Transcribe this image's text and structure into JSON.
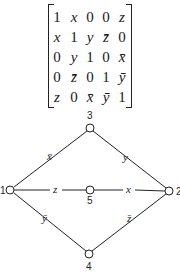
{
  "matrix": {
    "rows": [
      [
        "1",
        "x",
        "0",
        "0",
        "z"
      ],
      [
        "x",
        "1",
        "y",
        "z̄",
        "0"
      ],
      [
        "0",
        "y",
        "1",
        "0",
        "x̄"
      ],
      [
        "0",
        "z̄",
        "0",
        "1",
        "ȳ"
      ],
      [
        "z",
        "0",
        "x̄",
        "ȳ",
        "1"
      ]
    ]
  },
  "graph": {
    "nodes": [
      {
        "id": "1",
        "label": "1",
        "x": 10,
        "y": 190
      },
      {
        "id": "2",
        "label": "2",
        "x": 169,
        "y": 191
      },
      {
        "id": "3",
        "label": "3",
        "x": 90,
        "y": 128
      },
      {
        "id": "4",
        "label": "4",
        "x": 89,
        "y": 254
      },
      {
        "id": "5",
        "label": "5",
        "x": 90,
        "y": 190
      }
    ],
    "edges": [
      {
        "from": "1",
        "to": "3",
        "label": "x̄"
      },
      {
        "from": "3",
        "to": "2",
        "label": "y"
      },
      {
        "from": "1",
        "to": "5",
        "label": "z"
      },
      {
        "from": "5",
        "to": "2",
        "label": "x"
      },
      {
        "from": "1",
        "to": "4",
        "label": "ȳ"
      },
      {
        "from": "4",
        "to": "2",
        "label": "z̄"
      }
    ]
  }
}
